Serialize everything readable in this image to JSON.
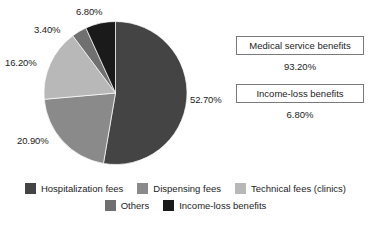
{
  "chart_data": {
    "type": "pie",
    "title": "",
    "categories": [
      "Hospitalization fees",
      "Dispensing fees",
      "Technical fees (clinics)",
      "Others",
      "Income-loss benefits"
    ],
    "values": [
      52.7,
      20.9,
      16.2,
      3.4,
      6.8
    ],
    "value_labels": [
      "52.70%",
      "20.90%",
      "16.20%",
      "3.40%",
      "6.80%"
    ],
    "colors": [
      "#444444",
      "#8a8a8a",
      "#b8b8b8",
      "#707070",
      "#1a1a1a"
    ],
    "start_angle_deg": 0,
    "direction": "clockwise",
    "legend_position": "bottom",
    "grid": false
  },
  "pie": {
    "slices": [
      {
        "label": "Hospitalization fees",
        "pct_text": "52.70%",
        "value": 52.7,
        "color": "#444444"
      },
      {
        "label": "Dispensing fees",
        "pct_text": "20.90%",
        "value": 20.9,
        "color": "#8a8a8a"
      },
      {
        "label": "Technical fees (clinics)",
        "pct_text": "16.20%",
        "value": 16.2,
        "color": "#b8b8b8"
      },
      {
        "label": "Others",
        "pct_text": "3.40%",
        "value": 3.4,
        "color": "#707070"
      },
      {
        "label": "Income-loss benefits",
        "pct_text": "6.80%",
        "value": 6.8,
        "color": "#1a1a1a"
      }
    ]
  },
  "summary": {
    "blocks": [
      {
        "title": "Medical service benefits",
        "value": "93.20%"
      },
      {
        "title": "Income-loss benefits",
        "value": "6.80%"
      }
    ]
  },
  "legend": {
    "rows": [
      [
        {
          "label": "Hospitalization fees",
          "color": "#444444"
        },
        {
          "label": "Dispensing fees",
          "color": "#8a8a8a"
        },
        {
          "label": "Technical fees (clinics)",
          "color": "#b8b8b8"
        }
      ],
      [
        {
          "label": "Others",
          "color": "#707070"
        },
        {
          "label": "Income-loss benefits",
          "color": "#1a1a1a"
        }
      ]
    ]
  }
}
